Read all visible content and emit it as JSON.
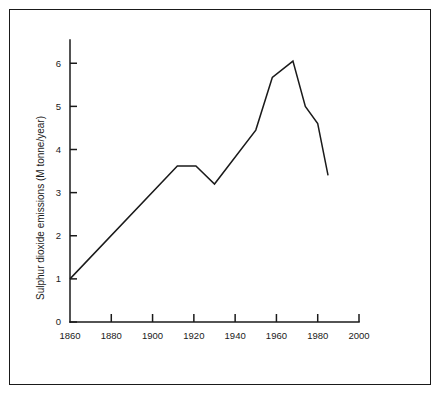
{
  "figure": {
    "border_color": "#1a1a1a",
    "background_color": "#ffffff"
  },
  "chart_data": {
    "type": "line",
    "title": "",
    "subtitle": "",
    "xlabel": "",
    "ylabel": "Sulphur dioxide emissions (M tonne/year)",
    "xlim": [
      1860,
      2000
    ],
    "ylim": [
      0,
      6.4
    ],
    "xticks": [
      1860,
      1880,
      1900,
      1920,
      1940,
      1960,
      1980,
      2000
    ],
    "xtick_labels": [
      "1860",
      "1880",
      "1900",
      "1920",
      "1940",
      "1960",
      "1980",
      "2000"
    ],
    "yticks": [
      0,
      1,
      2,
      3,
      4,
      5,
      6
    ],
    "ytick_labels": [
      "0",
      "1",
      "2",
      "3",
      "4",
      "5",
      "6"
    ],
    "grid": false,
    "legend": false,
    "legend_position": "none",
    "line_color": "#1a1a1a",
    "series": [
      {
        "name": "Sulphur dioxide emissions",
        "x": [
          1860,
          1912,
          1921,
          1930,
          1950,
          1958,
          1968,
          1974,
          1980,
          1985
        ],
        "values": [
          1.0,
          3.62,
          3.62,
          3.2,
          4.45,
          5.67,
          6.05,
          5.0,
          4.6,
          3.4
        ]
      }
    ]
  },
  "axis": {
    "y_axis_name": "y-axis",
    "x_axis_name": "x-axis"
  }
}
